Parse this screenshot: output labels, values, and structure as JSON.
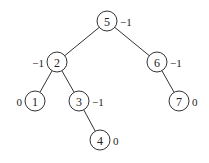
{
  "diagram": {
    "type": "binary-search-tree",
    "node_radius": 10,
    "nodes": [
      {
        "id": "n5",
        "key": "5",
        "balance": "−1",
        "cx": 107,
        "cy": 21,
        "label_side": "right"
      },
      {
        "id": "n2",
        "key": "2",
        "balance": "−1",
        "cx": 57,
        "cy": 62,
        "label_side": "left"
      },
      {
        "id": "n6",
        "key": "6",
        "balance": "−1",
        "cx": 157,
        "cy": 62,
        "label_side": "right"
      },
      {
        "id": "n1",
        "key": "1",
        "balance": "0",
        "cx": 35,
        "cy": 101,
        "label_side": "left"
      },
      {
        "id": "n3",
        "key": "3",
        "balance": "−1",
        "cx": 79,
        "cy": 101,
        "label_side": "right"
      },
      {
        "id": "n7",
        "key": "7",
        "balance": "0",
        "cx": 179,
        "cy": 101,
        "label_side": "right"
      },
      {
        "id": "n4",
        "key": "4",
        "balance": "0",
        "cx": 100,
        "cy": 140,
        "label_side": "right"
      }
    ],
    "edges": [
      {
        "from": "n5",
        "to": "n2"
      },
      {
        "from": "n5",
        "to": "n6"
      },
      {
        "from": "n2",
        "to": "n1"
      },
      {
        "from": "n2",
        "to": "n3"
      },
      {
        "from": "n6",
        "to": "n7"
      },
      {
        "from": "n3",
        "to": "n4"
      }
    ]
  }
}
